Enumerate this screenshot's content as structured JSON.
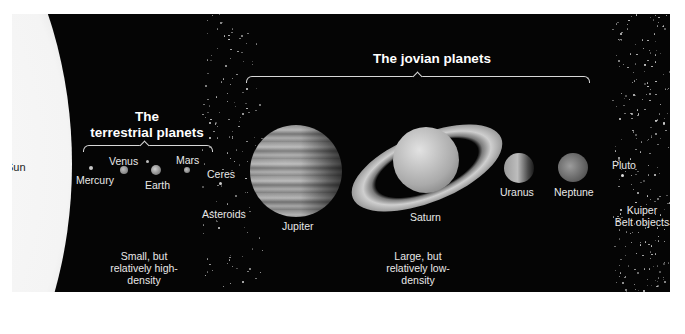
{
  "diagram": {
    "sun": {
      "label": "Sun"
    },
    "groups": {
      "terrestrial": {
        "heading_line1": "The",
        "heading_line2": "terrestrial planets",
        "description_line1": "Small, but",
        "description_line2": "relatively high-",
        "description_line3": "density"
      },
      "jovian": {
        "heading": "The jovian planets",
        "description_line1": "Large, but",
        "description_line2": "relatively low-",
        "description_line3": "density"
      }
    },
    "bodies": {
      "mercury": "Mercury",
      "venus": "Venus",
      "earth": "Earth",
      "mars": "Mars",
      "ceres": "Ceres",
      "asteroids": "Asteroids",
      "jupiter": "Jupiter",
      "saturn": "Saturn",
      "uranus": "Uranus",
      "neptune": "Neptune",
      "pluto": "Pluto",
      "kuiper_line1": "Kuiper",
      "kuiper_line2": "Belt objects"
    },
    "colors": {
      "background": "#050505",
      "text": "#e8e8e8",
      "sun": "#f4f4f4"
    }
  }
}
